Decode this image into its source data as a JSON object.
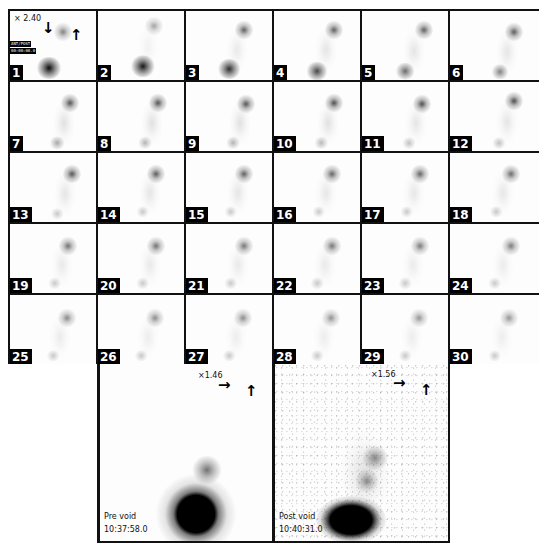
{
  "montage": {
    "columns": 6,
    "rows": 5,
    "frame_1_scale": "× 2.40",
    "frame_1_tag_lines": [
      "ANT/POST",
      "00:00:00.0"
    ],
    "frame_1_arrows": [
      "down-arrow",
      "up-arrow"
    ],
    "frames": [
      {
        "n": "1",
        "kidney": [
          0.62,
          0.3,
          0.55
        ],
        "bladder": [
          0.45,
          0.82,
          1.0
        ],
        "trail": 0.0
      },
      {
        "n": "2",
        "kidney": [
          0.65,
          0.22,
          0.4
        ],
        "bladder": [
          0.52,
          0.8,
          0.95
        ],
        "trail": 0.15
      },
      {
        "n": "3",
        "kidney": [
          0.68,
          0.28,
          0.7
        ],
        "bladder": [
          0.5,
          0.84,
          0.85
        ],
        "trail": 0.25
      },
      {
        "n": "4",
        "kidney": [
          0.7,
          0.27,
          0.7
        ],
        "bladder": [
          0.5,
          0.87,
          0.75
        ],
        "trail": 0.3
      },
      {
        "n": "5",
        "kidney": [
          0.72,
          0.28,
          0.7
        ],
        "bladder": [
          0.5,
          0.87,
          0.6
        ],
        "trail": 0.3
      },
      {
        "n": "6",
        "kidney": [
          0.72,
          0.3,
          0.72
        ],
        "bladder": [
          0.56,
          0.88,
          0.5
        ],
        "trail": 0.3
      },
      {
        "n": "7",
        "kidney": [
          0.7,
          0.3,
          0.75
        ],
        "bladder": [
          0.55,
          0.88,
          0.35
        ],
        "trail": 0.35
      },
      {
        "n": "8",
        "kidney": [
          0.7,
          0.3,
          0.75
        ],
        "bladder": [
          0.55,
          0.88,
          0.3
        ],
        "trail": 0.35
      },
      {
        "n": "9",
        "kidney": [
          0.7,
          0.32,
          0.75
        ],
        "bladder": [
          0.55,
          0.88,
          0.3
        ],
        "trail": 0.35
      },
      {
        "n": "10",
        "kidney": [
          0.7,
          0.3,
          0.78
        ],
        "bladder": [
          0.55,
          0.88,
          0.28
        ],
        "trail": 0.35
      },
      {
        "n": "11",
        "kidney": [
          0.7,
          0.32,
          0.78
        ],
        "bladder": [
          0.55,
          0.88,
          0.25
        ],
        "trail": 0.3
      },
      {
        "n": "12",
        "kidney": [
          0.72,
          0.28,
          0.78
        ],
        "bladder": [
          0.55,
          0.88,
          0.25
        ],
        "trail": 0.3
      },
      {
        "n": "13",
        "kidney": [
          0.72,
          0.3,
          0.75
        ],
        "bladder": [
          0.55,
          0.88,
          0.22
        ],
        "trail": 0.3
      },
      {
        "n": "14",
        "kidney": [
          0.68,
          0.3,
          0.72
        ],
        "bladder": [
          0.52,
          0.85,
          0.22
        ],
        "trail": 0.3
      },
      {
        "n": "15",
        "kidney": [
          0.68,
          0.3,
          0.7
        ],
        "bladder": [
          0.52,
          0.85,
          0.22
        ],
        "trail": 0.3
      },
      {
        "n": "16",
        "kidney": [
          0.68,
          0.3,
          0.68
        ],
        "bladder": [
          0.52,
          0.85,
          0.22
        ],
        "trail": 0.28
      },
      {
        "n": "17",
        "kidney": [
          0.68,
          0.3,
          0.68
        ],
        "bladder": [
          0.52,
          0.85,
          0.22
        ],
        "trail": 0.28
      },
      {
        "n": "18",
        "kidney": [
          0.68,
          0.3,
          0.65
        ],
        "bladder": [
          0.52,
          0.85,
          0.22
        ],
        "trail": 0.28
      },
      {
        "n": "19",
        "kidney": [
          0.68,
          0.32,
          0.62
        ],
        "bladder": [
          0.52,
          0.86,
          0.22
        ],
        "trail": 0.25
      },
      {
        "n": "20",
        "kidney": [
          0.68,
          0.32,
          0.62
        ],
        "bladder": [
          0.52,
          0.86,
          0.22
        ],
        "trail": 0.25
      },
      {
        "n": "21",
        "kidney": [
          0.68,
          0.32,
          0.6
        ],
        "bladder": [
          0.52,
          0.86,
          0.22
        ],
        "trail": 0.25
      },
      {
        "n": "22",
        "kidney": [
          0.68,
          0.32,
          0.6
        ],
        "bladder": [
          0.5,
          0.86,
          0.22
        ],
        "trail": 0.25
      },
      {
        "n": "23",
        "kidney": [
          0.68,
          0.32,
          0.58
        ],
        "bladder": [
          0.5,
          0.86,
          0.22
        ],
        "trail": 0.22
      },
      {
        "n": "24",
        "kidney": [
          0.68,
          0.32,
          0.58
        ],
        "bladder": [
          0.5,
          0.86,
          0.22
        ],
        "trail": 0.22
      },
      {
        "n": "25",
        "kidney": [
          0.66,
          0.34,
          0.52
        ],
        "bladder": [
          0.5,
          0.88,
          0.22
        ],
        "trail": 0.22
      },
      {
        "n": "26",
        "kidney": [
          0.66,
          0.34,
          0.5
        ],
        "bladder": [
          0.5,
          0.88,
          0.22
        ],
        "trail": 0.2
      },
      {
        "n": "27",
        "kidney": [
          0.66,
          0.34,
          0.5
        ],
        "bladder": [
          0.5,
          0.88,
          0.22
        ],
        "trail": 0.2
      },
      {
        "n": "28",
        "kidney": [
          0.66,
          0.34,
          0.48
        ],
        "bladder": [
          0.5,
          0.88,
          0.22
        ],
        "trail": 0.2
      },
      {
        "n": "29",
        "kidney": [
          0.66,
          0.34,
          0.46
        ],
        "bladder": [
          0.5,
          0.88,
          0.22
        ],
        "trail": 0.2
      },
      {
        "n": "30",
        "kidney": [
          0.66,
          0.34,
          0.46
        ],
        "bladder": [
          0.5,
          0.88,
          0.22
        ],
        "trail": 0.2
      }
    ]
  },
  "pre_void": {
    "scale": "×1.46",
    "label": "Pre void",
    "time": "10:37:58.0",
    "arrows": [
      "right-arrow",
      "up-arrow"
    ]
  },
  "post_void": {
    "scale": "×1.56",
    "label": "Post void",
    "time": "10:40:31.0",
    "arrows": [
      "right-arrow",
      "up-arrow"
    ]
  }
}
